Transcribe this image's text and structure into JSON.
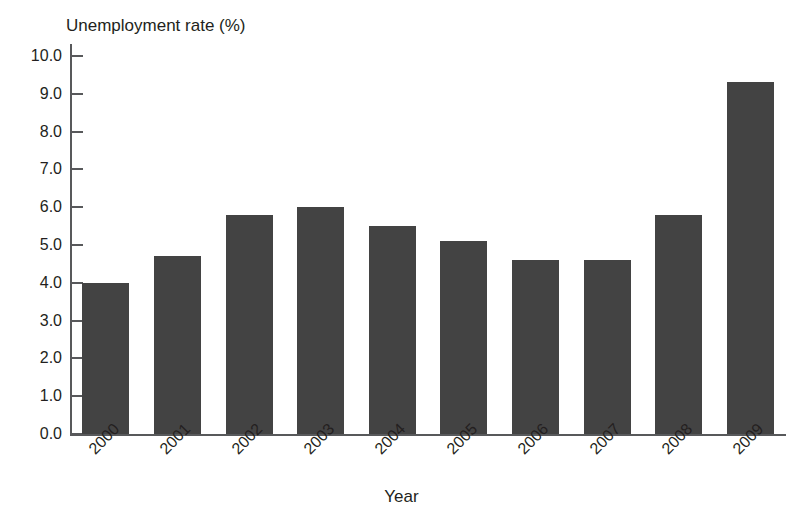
{
  "chart_data": {
    "type": "bar",
    "title": "",
    "xlabel": "Year",
    "ylabel": "Unemployment rate (%)",
    "categories": [
      "2000",
      "2001",
      "2002",
      "2003",
      "2004",
      "2005",
      "2006",
      "2007",
      "2008",
      "2009"
    ],
    "values": [
      4.0,
      4.7,
      5.8,
      6.0,
      5.5,
      5.1,
      4.6,
      4.6,
      5.8,
      9.3
    ],
    "ylim": [
      0.0,
      10.0
    ],
    "ytick_labels": [
      "10.0",
      "9.0",
      "8.0",
      "7.0",
      "6.0",
      "5.0",
      "4.0",
      "3.0",
      "2.0",
      "1.0",
      "0.0"
    ],
    "ytick_values": [
      10.0,
      9.0,
      8.0,
      7.0,
      6.0,
      5.0,
      4.0,
      3.0,
      2.0,
      1.0,
      0.0
    ],
    "ytick_step": 1.0,
    "grid": false,
    "legend": false,
    "legend_position": "none",
    "bar_color": "#434343",
    "axis_color": "#58595b",
    "text_color": "#231f20",
    "background_color": "#ffffff",
    "xtick_label_rotation": -45
  }
}
